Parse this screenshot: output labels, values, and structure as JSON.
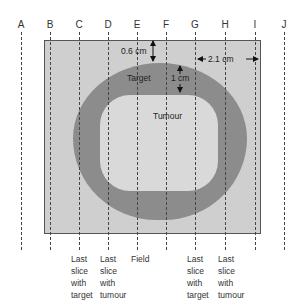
{
  "columns": [
    "A",
    "B",
    "C",
    "D",
    "E",
    "F",
    "G",
    "H",
    "I",
    "J"
  ],
  "regions": {
    "target": "Target",
    "tumour": "Tumour"
  },
  "measurements": {
    "margin_top": "0.6 cm",
    "target_thickness": "1 cm",
    "field_margin_right": "2.1 cm"
  },
  "bottom_labels": [
    {
      "column": "C",
      "text": "Last slice with target"
    },
    {
      "column": "D",
      "text": "Last slice with tumour"
    },
    {
      "column": "E",
      "text": "Field"
    },
    {
      "column": "G",
      "text": "Last slice with target"
    },
    {
      "column": "H",
      "text": "Last slice with tumour"
    }
  ],
  "bottom_label_lines": {
    "c": [
      "Last",
      "slice",
      "with",
      "target"
    ],
    "d": [
      "Last",
      "slice",
      "with",
      "tumour"
    ],
    "e": [
      "Field"
    ],
    "g": [
      "Last",
      "slice",
      "with",
      "target"
    ],
    "h": [
      "Last",
      "slice",
      "with",
      "tumour"
    ]
  },
  "colors": {
    "field": "#cfcfcf",
    "target": "#8c8c8c",
    "tumour": "#d9d9d9"
  }
}
